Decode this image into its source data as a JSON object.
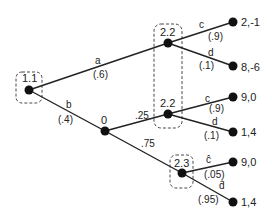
{
  "diagram": {
    "type": "game-tree",
    "nodes": [
      {
        "id": "root",
        "label": "1.1",
        "x": 29,
        "y": 90
      },
      {
        "id": "p2a",
        "label": "2.2",
        "x": 168,
        "y": 43
      },
      {
        "id": "chance",
        "label": "0",
        "x": 105,
        "y": 131
      },
      {
        "id": "p2b",
        "label": "2.2",
        "x": 168,
        "y": 114
      },
      {
        "id": "p3",
        "label": "2.3",
        "x": 182,
        "y": 173
      }
    ],
    "terminals": [
      {
        "id": "t1",
        "payoff": "2,-1",
        "x": 233,
        "y": 22
      },
      {
        "id": "t2",
        "payoff": "8,-6",
        "x": 233,
        "y": 66
      },
      {
        "id": "t3",
        "payoff": "9,0",
        "x": 233,
        "y": 97
      },
      {
        "id": "t4",
        "payoff": "1,4",
        "x": 233,
        "y": 132
      },
      {
        "id": "t5",
        "payoff": "9,0",
        "x": 233,
        "y": 162
      },
      {
        "id": "t6",
        "payoff": "1,4",
        "x": 233,
        "y": 202
      }
    ],
    "edges": [
      {
        "from": "root",
        "to": "p2a",
        "action": "a",
        "prob": "(.6)"
      },
      {
        "from": "root",
        "to": "chance",
        "action": "b",
        "prob": "(.4)"
      },
      {
        "from": "chance",
        "to": "p2b",
        "action": "",
        "prob": ".25"
      },
      {
        "from": "chance",
        "to": "p3",
        "action": "",
        "prob": ".75"
      },
      {
        "from": "p2a",
        "to": "t1",
        "action": "c",
        "prob": "(.9)"
      },
      {
        "from": "p2a",
        "to": "t2",
        "action": "d",
        "prob": "(.1)"
      },
      {
        "from": "p2b",
        "to": "t3",
        "action": "c",
        "prob": "(.9)"
      },
      {
        "from": "p2b",
        "to": "t4",
        "action": "d",
        "prob": "(.1)"
      },
      {
        "from": "p3",
        "to": "t5",
        "action": "ĉ",
        "prob": "(.05)"
      },
      {
        "from": "p3",
        "to": "t6",
        "action": "d̂",
        "prob": "(.95)"
      }
    ],
    "info_sets": [
      {
        "label": "player-1-infoset",
        "members": [
          "root"
        ]
      },
      {
        "label": "player-2-infoset-2.2",
        "members": [
          "p2a",
          "p2b"
        ]
      },
      {
        "label": "player-2-infoset-2.3",
        "members": [
          "p3"
        ]
      }
    ]
  }
}
